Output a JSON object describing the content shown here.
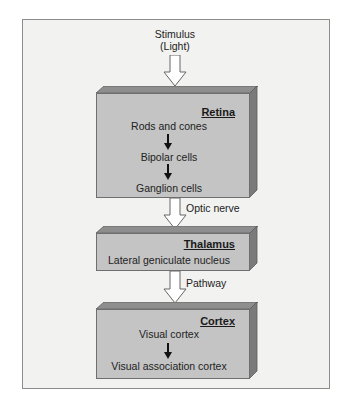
{
  "diagram": {
    "input": {
      "line1": "Stimulus",
      "line2": "(Light)"
    },
    "stages": [
      {
        "title": "Retina",
        "items": [
          "Rods and cones",
          "Bipolar cells",
          "Ganglion cells"
        ]
      },
      {
        "title": "Thalamus",
        "items": [
          "Lateral geniculate nucleus"
        ]
      },
      {
        "title": "Cortex",
        "items": [
          "Visual cortex",
          "Visual association cortex"
        ]
      }
    ],
    "connectors": [
      "Optic nerve",
      "Pathway"
    ]
  },
  "colors": {
    "frame_bg": "#f2f2f1",
    "box_front": "#c4c4c4",
    "box_top": "#8e8e8e",
    "box_side": "#7a7a7a",
    "arrow_fill": "#ffffff",
    "text": "#222222"
  }
}
